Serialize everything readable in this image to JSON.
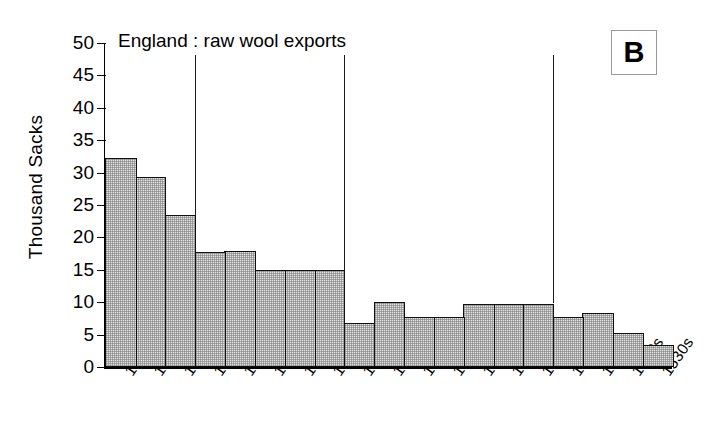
{
  "chart_data": {
    "type": "bar",
    "title": "England : raw wool exports",
    "panel_label": "B",
    "xlabel": "",
    "ylabel": "Thousand Sacks",
    "ylim": [
      0,
      50
    ],
    "ytick_step": 5,
    "yticks": [
      0,
      5,
      10,
      15,
      20,
      25,
      30,
      35,
      40,
      45,
      50
    ],
    "grid": false,
    "legend": false,
    "units": "thousand sacks",
    "categories": [
      "1350s",
      "1360s",
      "1370s",
      "1380s",
      "1390s",
      "1400s",
      "1410s",
      "1420s",
      "1430s",
      "1440s",
      "1450s",
      "1460s",
      "1470s",
      "1480s",
      "1490s",
      "1500s",
      "1510s",
      "1520s",
      "1530s"
    ],
    "values": [
      32.2,
      29.3,
      23.4,
      17.8,
      17.9,
      14.9,
      14.9,
      14.9,
      6.8,
      10.0,
      7.7,
      7.7,
      9.8,
      9.8,
      9.8,
      7.7,
      8.4,
      5.2,
      3.4
    ],
    "dividers_after_category": [
      "1370s",
      "1420s",
      "1490s"
    ],
    "bar_fill_color": "#e2e2e2",
    "bar_edge_color": "#111111",
    "axis_color": "#000000",
    "background_color": "#ffffff"
  }
}
